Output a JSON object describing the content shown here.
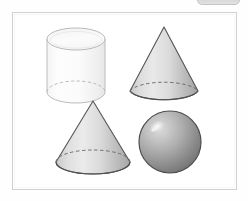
{
  "window": {
    "top_pill_label": ""
  },
  "figure": {
    "title": "",
    "background_color": "#ffffff",
    "border_color": "#d0d0d0",
    "solids": [
      {
        "id": "cylinder",
        "name": "cylinder",
        "label": "",
        "position": "top-left",
        "fill_light": "#fdfdfd",
        "fill_dark": "#f0f0f0",
        "stroke": "#b9b9b9",
        "hidden_edge_style": "dashed"
      },
      {
        "id": "cone-tall",
        "name": "cone",
        "label": "",
        "position": "top-right",
        "fill_light": "#e8e8e8",
        "fill_dark": "#a8a8a8",
        "stroke": "#545454",
        "hidden_edge_style": "dashed"
      },
      {
        "id": "cone-wide",
        "name": "cone",
        "label": "",
        "position": "bottom-left",
        "fill_light": "#eaeaea",
        "fill_dark": "#aaaaaa",
        "stroke": "#565656",
        "hidden_edge_style": "dashed"
      },
      {
        "id": "sphere",
        "name": "sphere",
        "label": "",
        "position": "bottom-right",
        "fill_light": "#d8d8d8",
        "fill_dark": "#707070",
        "stroke": "#4d4d4d",
        "highlight_color": "#f2f2f2"
      }
    ]
  }
}
